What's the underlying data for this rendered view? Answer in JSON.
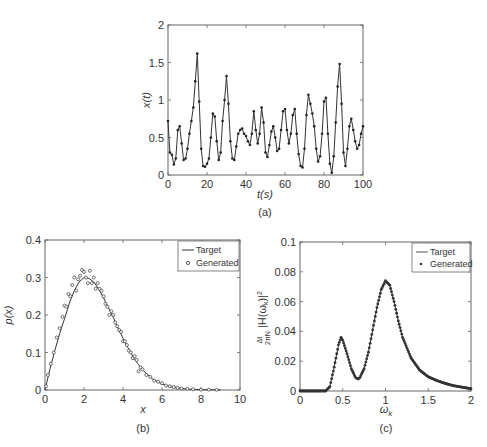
{
  "chart_data": [
    {
      "id": "a",
      "type": "line",
      "caption": "(a)",
      "title": "",
      "xlabel": "t(s)",
      "ylabel": "x(t)",
      "xlim": [
        0,
        100
      ],
      "ylim": [
        0,
        2
      ],
      "xticks": [
        "0",
        "20",
        "40",
        "60",
        "80",
        "100"
      ],
      "yticks": [
        "0",
        "0.5",
        "1",
        "1.5",
        "2"
      ],
      "grid": false,
      "markers": true,
      "x": [
        0,
        1,
        2,
        3,
        4,
        5,
        6,
        7,
        8,
        9,
        10,
        11,
        12,
        13,
        14,
        15,
        16,
        17,
        18,
        19,
        20,
        21,
        22,
        23,
        24,
        25,
        26,
        27,
        28,
        29,
        30,
        31,
        32,
        33,
        34,
        35,
        36,
        37,
        38,
        39,
        40,
        41,
        42,
        43,
        44,
        45,
        46,
        47,
        48,
        49,
        50,
        51,
        52,
        53,
        54,
        55,
        56,
        57,
        58,
        59,
        60,
        61,
        62,
        63,
        64,
        65,
        66,
        67,
        68,
        69,
        70,
        71,
        72,
        73,
        74,
        75,
        76,
        77,
        78,
        79,
        80,
        81,
        82,
        83,
        84,
        85,
        86,
        87,
        88,
        89,
        90,
        91,
        92,
        93,
        94,
        95,
        96,
        97,
        98,
        99,
        100
      ],
      "values": [
        0.72,
        0.3,
        0.27,
        0.14,
        0.22,
        0.6,
        0.65,
        0.42,
        0.2,
        0.22,
        0.35,
        0.55,
        0.72,
        0.9,
        1.25,
        1.62,
        0.98,
        0.35,
        0.12,
        0.11,
        0.15,
        0.22,
        0.5,
        0.82,
        0.78,
        0.45,
        0.2,
        0.3,
        0.72,
        1.0,
        1.32,
        0.95,
        0.45,
        0.22,
        0.2,
        0.38,
        0.55,
        0.6,
        0.62,
        0.55,
        0.52,
        0.45,
        0.4,
        0.55,
        0.85,
        0.6,
        0.42,
        0.55,
        0.9,
        0.7,
        0.3,
        0.24,
        0.4,
        0.58,
        0.65,
        0.5,
        0.32,
        0.35,
        0.6,
        0.85,
        0.88,
        0.6,
        0.42,
        0.55,
        0.8,
        0.88,
        0.55,
        0.28,
        0.12,
        0.1,
        0.35,
        0.8,
        1.07,
        0.95,
        0.82,
        0.65,
        0.35,
        0.18,
        0.25,
        0.55,
        0.98,
        1.03,
        0.55,
        0.15,
        0.03,
        0.25,
        0.7,
        1.18,
        1.48,
        0.95,
        0.3,
        0.12,
        0.35,
        0.65,
        0.75,
        0.6,
        0.45,
        0.35,
        0.4,
        0.55,
        0.65,
        0.4,
        0.18,
        0.12,
        0.45,
        0.9,
        1.1,
        1.02,
        0.88
      ],
      "legend": []
    },
    {
      "id": "b",
      "type": "scatter",
      "caption": "(b)",
      "title": "",
      "xlabel": "x",
      "ylabel": "p(x)",
      "xlim": [
        0,
        10
      ],
      "ylim": [
        0,
        0.4
      ],
      "xticks": [
        "0",
        "2",
        "4",
        "6",
        "8",
        "10"
      ],
      "yticks": [
        "0",
        "0.1",
        "0.2",
        "0.3",
        "0.4"
      ],
      "grid": false,
      "legend_position": "upper right",
      "series": [
        {
          "name": "Target",
          "style": "line",
          "x": [
            0,
            0.25,
            0.5,
            0.75,
            1,
            1.25,
            1.5,
            1.75,
            2,
            2.25,
            2.5,
            2.75,
            3,
            3.25,
            3.5,
            3.75,
            4,
            4.25,
            4.5,
            4.75,
            5,
            5.5,
            6,
            6.5,
            7,
            7.5,
            8,
            8.5,
            9
          ],
          "values": [
            0,
            0.055,
            0.105,
            0.15,
            0.19,
            0.232,
            0.265,
            0.288,
            0.3,
            0.298,
            0.288,
            0.27,
            0.246,
            0.22,
            0.193,
            0.165,
            0.138,
            0.113,
            0.09,
            0.071,
            0.054,
            0.03,
            0.016,
            0.008,
            0.004,
            0.002,
            0.001,
            0.0005,
            0.0002
          ]
        },
        {
          "name": "Generated",
          "style": "markers",
          "x": [
            0.05,
            0.15,
            0.3,
            0.45,
            0.6,
            0.75,
            0.9,
            1.0,
            1.1,
            1.2,
            1.3,
            1.4,
            1.5,
            1.6,
            1.7,
            1.8,
            1.9,
            2.0,
            2.1,
            2.2,
            2.3,
            2.4,
            2.5,
            2.6,
            2.7,
            2.8,
            2.9,
            3.0,
            3.1,
            3.2,
            3.3,
            3.4,
            3.5,
            3.6,
            3.7,
            3.8,
            3.9,
            4.0,
            4.1,
            4.2,
            4.3,
            4.4,
            4.5,
            4.6,
            4.7,
            4.8,
            4.9,
            5.0,
            5.2,
            5.4,
            5.6,
            5.8,
            6.0,
            6.2,
            6.4,
            6.6,
            6.8,
            7.0,
            7.3,
            7.6,
            8.0,
            8.4,
            8.8
          ],
          "values": [
            0.01,
            0.04,
            0.07,
            0.1,
            0.14,
            0.165,
            0.195,
            0.225,
            0.222,
            0.256,
            0.25,
            0.28,
            0.3,
            0.265,
            0.295,
            0.305,
            0.32,
            0.315,
            0.3,
            0.285,
            0.318,
            0.285,
            0.3,
            0.27,
            0.285,
            0.27,
            0.265,
            0.25,
            0.23,
            0.222,
            0.2,
            0.21,
            0.2,
            0.18,
            0.17,
            0.16,
            0.155,
            0.13,
            0.13,
            0.12,
            0.105,
            0.1,
            0.085,
            0.09,
            0.08,
            0.05,
            0.06,
            0.055,
            0.04,
            0.035,
            0.025,
            0.022,
            0.018,
            0.012,
            0.01,
            0.008,
            0.006,
            0.004,
            0.003,
            0.002,
            0.001,
            0.001,
            0.0005
          ]
        }
      ]
    },
    {
      "id": "c",
      "type": "line",
      "caption": "(c)",
      "title": "",
      "xlabel": "ω_k",
      "ylabel": "Δt/(2πN) |H(ω_k)|²",
      "xlim": [
        0,
        2
      ],
      "ylim": [
        0,
        0.1
      ],
      "xticks": [
        "0",
        "0.5",
        "1",
        "1.5",
        "2"
      ],
      "yticks": [
        "0",
        "0.02",
        "0.04",
        "0.06",
        "0.08",
        "0.1"
      ],
      "grid": false,
      "legend_position": "upper right",
      "series": [
        {
          "name": "Target",
          "style": "line",
          "x": [
            0,
            0.1,
            0.2,
            0.3,
            0.35,
            0.4,
            0.45,
            0.48,
            0.5,
            0.55,
            0.6,
            0.65,
            0.68,
            0.7,
            0.75,
            0.8,
            0.85,
            0.9,
            0.95,
            1.0,
            1.05,
            1.1,
            1.15,
            1.2,
            1.3,
            1.4,
            1.5,
            1.6,
            1.7,
            1.8,
            1.9,
            2.0
          ],
          "values": [
            0,
            0,
            0,
            0,
            0.003,
            0.016,
            0.031,
            0.036,
            0.034,
            0.025,
            0.015,
            0.009,
            0.008,
            0.009,
            0.015,
            0.026,
            0.041,
            0.056,
            0.068,
            0.074,
            0.071,
            0.06,
            0.047,
            0.036,
            0.022,
            0.014,
            0.0095,
            0.007,
            0.005,
            0.0035,
            0.0025,
            0.0015
          ]
        },
        {
          "name": "Generated",
          "style": "markers",
          "x": [
            0,
            0.1,
            0.2,
            0.3,
            0.35,
            0.4,
            0.45,
            0.48,
            0.5,
            0.55,
            0.6,
            0.65,
            0.68,
            0.7,
            0.75,
            0.8,
            0.85,
            0.9,
            0.95,
            1.0,
            1.05,
            1.1,
            1.15,
            1.2,
            1.3,
            1.4,
            1.5,
            1.6,
            1.7,
            1.8,
            1.9,
            2.0
          ],
          "values": [
            0,
            0,
            0,
            0,
            0.003,
            0.016,
            0.031,
            0.036,
            0.034,
            0.025,
            0.015,
            0.009,
            0.008,
            0.009,
            0.015,
            0.026,
            0.041,
            0.056,
            0.068,
            0.074,
            0.071,
            0.06,
            0.047,
            0.036,
            0.022,
            0.014,
            0.0095,
            0.007,
            0.005,
            0.0035,
            0.0025,
            0.0015
          ]
        }
      ]
    }
  ],
  "legend": {
    "target_label": "Target",
    "generated_label": "Generated"
  },
  "colors": {
    "line": "#333333",
    "axis": "#555555",
    "marker_fill": "#ffffff"
  }
}
